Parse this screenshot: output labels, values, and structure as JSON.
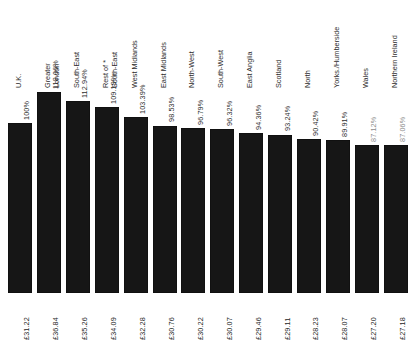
{
  "chart_data": {
    "type": "bar",
    "title": "",
    "subtitle": "",
    "xlabel": "",
    "ylabel": "",
    "ylim": [
      0,
      120
    ],
    "grid": false,
    "legend": "none",
    "orientation": "vertical",
    "baseline_category": "U.K.",
    "categories": [
      "U.K.",
      "Greater London",
      "South-East",
      "Rest of * South-East",
      "West Midlands",
      "East Midlands",
      "North-West",
      "South-West",
      "East Anglia",
      "Scotland",
      "North",
      "Yorks./Humberside",
      "Wales",
      "Northern Ireland"
    ],
    "category_lines": [
      [
        "U.K.",
        ""
      ],
      [
        "Greater",
        "London"
      ],
      [
        "South-East",
        ""
      ],
      [
        "Rest of *",
        "South-East"
      ],
      [
        "West Midlands",
        ""
      ],
      [
        "East Midlands",
        ""
      ],
      [
        "North-West",
        ""
      ],
      [
        "South-West",
        ""
      ],
      [
        "East Anglia",
        ""
      ],
      [
        "Scotland",
        ""
      ],
      [
        "North",
        ""
      ],
      [
        "Yorks./Humberside",
        ""
      ],
      [
        "Wales",
        ""
      ],
      [
        "Northern Ireland",
        ""
      ]
    ],
    "values": [
      100.0,
      118.06,
      112.94,
      109.19,
      103.39,
      98.53,
      96.79,
      96.32,
      94.36,
      93.24,
      90.42,
      89.91,
      87.12,
      87.06
    ],
    "percent_labels": [
      "100%",
      "118.06%",
      "112.94%",
      "109.19%",
      "103.39%",
      "98.53%",
      "96.79%",
      "96.32%",
      "94.36%",
      "93.24%",
      "90.42%",
      "89.91%",
      "87.12%",
      "87.06%"
    ],
    "value_labels": [
      "£31.22",
      "£36.84",
      "£35.26",
      "£34.09",
      "£32.28",
      "£30.76",
      "£30.22",
      "£30.07",
      "£29.46",
      "£29.11",
      "£28.23",
      "£28.07",
      "£27.20",
      "£27.18"
    ],
    "value_unit": "GBP",
    "bar_color": "#161616",
    "background_color": "#ffffff",
    "footnote_marker": "*"
  }
}
